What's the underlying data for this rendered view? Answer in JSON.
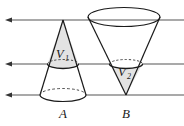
{
  "figure": {
    "canvas": {
      "width": 184,
      "height": 126,
      "background": "#ffffff"
    },
    "colors": {
      "line": "#555555",
      "outline": "#1a1a1a",
      "shade_fill": "#e3e3e3",
      "hidden_dash": "#333333",
      "label": "#1a1a1a"
    },
    "parallel_lines": [
      {
        "id": "line-top",
        "y": 20,
        "x_start": 10,
        "x_end": 184,
        "arrow": "left"
      },
      {
        "id": "line-middle",
        "y": 64,
        "x_start": 10,
        "x_end": 184,
        "arrow": "left"
      },
      {
        "id": "line-bottom",
        "y": 95,
        "x_start": 10,
        "x_end": 184,
        "arrow": "left"
      }
    ],
    "cones": [
      {
        "id": "cone-a",
        "label": "A",
        "label_x": 63,
        "label_y": 117,
        "orientation": "apex-up",
        "apex": {
          "x": 63,
          "y": 20
        },
        "base_ellipse": {
          "cx": 63,
          "cy": 95,
          "rx": 23,
          "ry": 6.5
        },
        "mid_ellipse": {
          "cx": 63,
          "cy": 64,
          "rx": 15.5,
          "ry": 4.5
        },
        "region_label": "V",
        "region_subscript": "1",
        "region_label_x": 59,
        "region_label_y": 58
      },
      {
        "id": "cone-b",
        "label": "B",
        "label_x": 126,
        "label_y": 117,
        "orientation": "apex-down",
        "apex": {
          "x": 126,
          "y": 95
        },
        "base_ellipse": {
          "cx": 124,
          "cy": 17,
          "rx": 36,
          "ry": 9.5
        },
        "mid_ellipse": {
          "cx": 126,
          "cy": 64,
          "rx": 16.5,
          "ry": 4.5
        },
        "region_label": "V",
        "region_subscript": "2",
        "region_label_x": 121,
        "region_label_y": 76
      }
    ]
  }
}
